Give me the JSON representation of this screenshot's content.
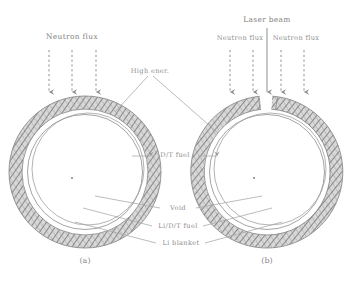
{
  "figure": {
    "width": 357,
    "height": 289,
    "background": "#ffffff",
    "ink": "#8d8d8d",
    "hatch_color": "#7a7a7a"
  },
  "labels": {
    "neutron_flux_left": "Neutron flux",
    "laser_beam": "Laser beam",
    "neutron_flux_right_a": "Neutron flux",
    "neutron_flux_right_b": "Neutron flux",
    "high_ener": "High ener.",
    "dt_fuel": "D/T fuel",
    "void": "Void",
    "li_dt_fuel": "Li/D/T fuel",
    "li_blanket": "Li blanket"
  },
  "captions": {
    "panel_a": "(a)",
    "panel_b": "(b)"
  },
  "panels": [
    {
      "id": "a",
      "caption": "(a)",
      "center_x": 85,
      "center_y": 172,
      "outer_radius": 76,
      "blanket_thickness": 13,
      "void_gap": 5,
      "inner_radius": 57,
      "has_laser_aperture": false,
      "arrow_count": 3
    },
    {
      "id": "b",
      "caption": "(b)",
      "center_x": 267,
      "center_y": 172,
      "outer_radius": 76,
      "blanket_thickness": 13,
      "void_gap": 5,
      "inner_radius": 57,
      "has_laser_aperture": true,
      "aperture_half_angle_deg": 9,
      "arrow_count": 4
    }
  ],
  "arrows": {
    "neutron_style": "dashed",
    "laser_style": "solid",
    "left_panel_x": [
      49,
      72,
      96
    ],
    "right_panel_x": [
      230,
      253,
      281,
      304
    ],
    "laser_x": 267,
    "top_y": 50,
    "bottom_y": 93,
    "laser_top_y": 28
  }
}
